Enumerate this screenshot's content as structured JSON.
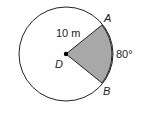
{
  "diagram": {
    "type": "circle-sector",
    "center_label": "D",
    "point_labels": {
      "top": "A",
      "bottom": "B"
    },
    "radius_label": "10 m",
    "angle_label": "80°",
    "colors": {
      "sector_fill": "#a8a8a8",
      "stroke": "#222222",
      "background": "#ffffff"
    }
  }
}
